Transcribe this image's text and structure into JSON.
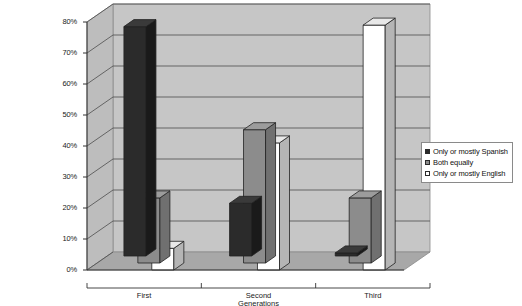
{
  "chart_data": {
    "type": "bar",
    "title": "",
    "subtitle": "",
    "xlabel": "Generations",
    "ylabel": "",
    "categories": [
      "First",
      "Second",
      "Third"
    ],
    "series": [
      {
        "name": "Only or mostly Spanish",
        "values": [
          74,
          17,
          1
        ],
        "color": "#2b2b2b"
      },
      {
        "name": "Both equally",
        "values": [
          21,
          43,
          21
        ],
        "color": "#8c8c8c"
      },
      {
        "name": "Only or mostly English",
        "values": [
          7,
          41,
          79
        ],
        "color": "#ffffff"
      }
    ],
    "ylim": [
      0,
      80
    ],
    "yticks": [
      "0%",
      "10%",
      "20%",
      "30%",
      "40%",
      "50%",
      "60%",
      "70%",
      "80%"
    ],
    "ytick_values": [
      0,
      10,
      20,
      30,
      40,
      50,
      60,
      70,
      80
    ],
    "grid": true,
    "legend_position": "right",
    "projection": "3d-column"
  },
  "legend": {
    "items": [
      {
        "label": "Only or mostly Spanish",
        "swatch": "#2b2b2b"
      },
      {
        "label": "Both equally",
        "swatch": "#8c8c8c"
      },
      {
        "label": "Only or mostly English",
        "swatch": "#ffffff"
      }
    ]
  },
  "colors": {
    "back_wall": "#c6c6c6",
    "side_wall": "#bdbdbd",
    "floor": "#a8a8a8",
    "gridline": "#4d4d4d",
    "axis": "#333333",
    "bar_dark": "#2b2b2b",
    "bar_dark_side": "#1a1a1a",
    "bar_dark_top": "#3a3a3a",
    "bar_gray": "#8c8c8c",
    "bar_gray_side": "#707070",
    "bar_gray_top": "#9c9c9c",
    "bar_white": "#ffffff",
    "bar_white_side": "#b5b5b5",
    "bar_white_top": "#e8e8e8",
    "frame": "#8a8a8a"
  }
}
